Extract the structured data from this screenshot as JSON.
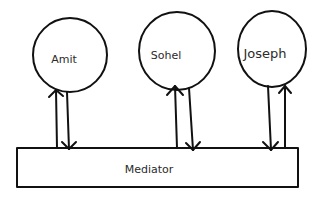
{
  "diagram": {
    "title": "",
    "colors": {
      "stroke": "#111111",
      "text": "#2b2b2b",
      "background": "#ffffff"
    },
    "nodes": [
      {
        "id": "amit",
        "label": "Amit",
        "shape": "circle"
      },
      {
        "id": "sohel",
        "label": "Sohel",
        "shape": "circle"
      },
      {
        "id": "joseph",
        "label": "Joseph",
        "shape": "circle"
      }
    ],
    "mediator": {
      "id": "mediator",
      "label": "Mediator",
      "shape": "rectangle"
    },
    "edges": [
      {
        "from": "mediator",
        "to": "amit",
        "direction": "up"
      },
      {
        "from": "amit",
        "to": "mediator",
        "direction": "down"
      },
      {
        "from": "mediator",
        "to": "sohel",
        "direction": "up"
      },
      {
        "from": "sohel",
        "to": "mediator",
        "direction": "down"
      },
      {
        "from": "joseph",
        "to": "mediator",
        "direction": "down"
      },
      {
        "from": "mediator",
        "to": "joseph",
        "direction": "up"
      }
    ]
  }
}
